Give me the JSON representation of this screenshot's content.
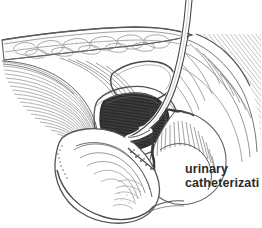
{
  "figure": {
    "kind": "anatomical-line-engraving",
    "background_color": "#ffffff",
    "ink_color": "#4a4a4a",
    "dark_fill_color": "#2a2a2a",
    "width": 262,
    "height": 228
  },
  "caption": {
    "line1": "urinary",
    "line2": "catheterizati",
    "note_truncated": true,
    "color": "#2b2b2b"
  },
  "structures": [
    {
      "id": "abdominal-wall",
      "label": "abdominal wall with subcutaneous fat"
    },
    {
      "id": "rectus-muscle",
      "label": "hatched muscle fibers"
    },
    {
      "id": "peritoneal-cavity",
      "label": "white crescent cavity"
    },
    {
      "id": "bladder-lumen",
      "label": "dark hatched bladder cavity"
    },
    {
      "id": "pubic-symphysis",
      "label": "pubic bone section"
    },
    {
      "id": "rectum",
      "label": "rectum with vertical hatching"
    },
    {
      "id": "penis-urethra",
      "label": "penile shaft and urethra"
    },
    {
      "id": "catheter-tube",
      "label": "catheter tube entering from above"
    }
  ]
}
